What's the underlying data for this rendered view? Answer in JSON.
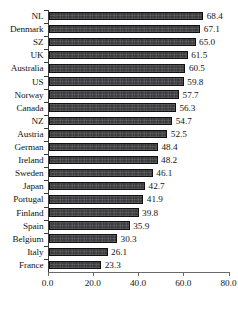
{
  "chart_data": {
    "type": "bar",
    "orientation": "horizontal",
    "title": "",
    "subtitle": "",
    "xlabel": "",
    "ylabel": "",
    "xlim": [
      0.0,
      80.0
    ],
    "xticks": [
      "0.0",
      "20.0",
      "40.0",
      "60.0",
      "80.0"
    ],
    "xtick_values": [
      0.0,
      20.0,
      40.0,
      60.0,
      80.0
    ],
    "grid": false,
    "legend": null,
    "value_labels": true,
    "categories": [
      "NL",
      "Denmark",
      "SZ",
      "UK",
      "Australia",
      "US",
      "Norway",
      "Canada",
      "NZ",
      "Austria",
      "German",
      "Ireland",
      "Sweden",
      "Japan",
      "Portugal",
      "Finland",
      "Spain",
      "Belgium",
      "Italy",
      "France"
    ],
    "values": [
      68.4,
      67.1,
      65.0,
      61.5,
      60.5,
      59.8,
      57.7,
      56.3,
      54.7,
      52.5,
      48.4,
      48.2,
      46.1,
      42.7,
      41.9,
      39.8,
      35.9,
      30.3,
      26.1,
      23.3
    ],
    "value_label_text": [
      "68.4",
      "67.1",
      "65.0",
      "61.5",
      "60.5",
      "59.8",
      "57.7",
      "56.3",
      "54.7",
      "52.5",
      "48.4",
      "48.2",
      "46.1",
      "42.7",
      "41.9",
      "39.8",
      "35.9",
      "30.3",
      "26.1",
      "23.3"
    ],
    "bar_color": "#37373a",
    "bar_edge_color": "#101010",
    "background_color": "#ffffff",
    "axis_color": "#3a3a3a",
    "text_color": "#141414"
  }
}
